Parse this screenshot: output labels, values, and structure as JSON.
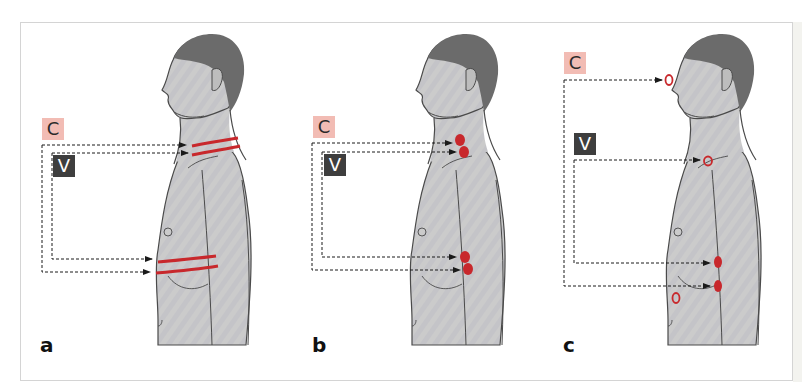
{
  "figure": {
    "panels": [
      {
        "letter": "a",
        "labels": {
          "c": "C",
          "v": "V"
        },
        "marking_type": "bands",
        "description": "Red bands around neck and lower chest"
      },
      {
        "letter": "b",
        "labels": {
          "c": "C",
          "v": "V"
        },
        "marking_type": "filled-spots",
        "description": "Filled red spots at neck and flank"
      },
      {
        "letter": "c",
        "labels": {
          "c": "C",
          "v": "V"
        },
        "marking_type": "mixed-spots",
        "description": "Outlined circles at forehead, neck base and abdomen; filled spots on flank"
      }
    ],
    "colors": {
      "c_label_bg": "#f2bcb4",
      "v_label_bg": "#3e3e3e",
      "marker_red": "#c8282c",
      "skin": "#c9c9c9",
      "hair": "#6b6b6b",
      "outline": "#4a4a4a"
    }
  }
}
